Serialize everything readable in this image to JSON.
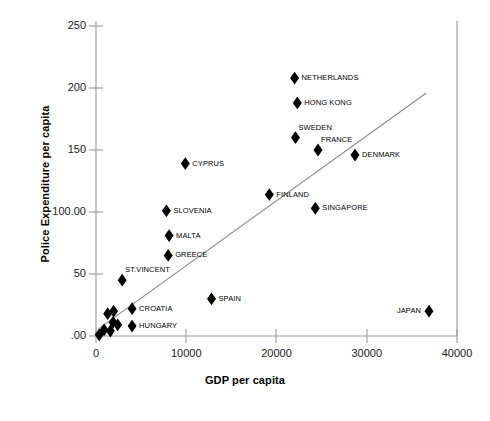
{
  "chart_data": {
    "type": "scatter",
    "title": "",
    "xlabel": "GDP per capita",
    "ylabel": "Police Expenditure per capita",
    "xlim": [
      0,
      40000
    ],
    "ylim": [
      0,
      260
    ],
    "grid": false,
    "legend": "none",
    "marker": "filled-diamond",
    "marker_color": "#000000",
    "xticks": [
      0,
      10000,
      20000,
      30000,
      40000
    ],
    "xtick_labels": [
      "0",
      "10000",
      "20000",
      "30000",
      "40000"
    ],
    "yticks": [
      0,
      50,
      100,
      150,
      200,
      250
    ],
    "ytick_labels": [
      ".00",
      "50",
      "100.00",
      "150",
      "200",
      "250"
    ],
    "trendline": {
      "present": true,
      "x_start": 300,
      "y_start": 6,
      "x_end": 36600,
      "y_end": 196
    },
    "points": [
      {
        "label": "NETHERLANDS",
        "x": 22000,
        "y": 208,
        "label_pos": "right"
      },
      {
        "label": "HONG KONG",
        "x": 22300,
        "y": 188,
        "label_pos": "right"
      },
      {
        "label": "SWEDEN",
        "x": 22100,
        "y": 160,
        "label_pos": "above-right"
      },
      {
        "label": "FRANCE",
        "x": 24600,
        "y": 150,
        "label_pos": "above-right"
      },
      {
        "label": "DENMARK",
        "x": 28700,
        "y": 146,
        "label_pos": "right"
      },
      {
        "label": "CYPRUS",
        "x": 9900,
        "y": 139,
        "label_pos": "right"
      },
      {
        "label": "FINLAND",
        "x": 19200,
        "y": 114,
        "label_pos": "right"
      },
      {
        "label": "SINGAPORE",
        "x": 24300,
        "y": 103,
        "label_pos": "right"
      },
      {
        "label": "SLOVENIA",
        "x": 7800,
        "y": 101,
        "label_pos": "right"
      },
      {
        "label": "MALTA",
        "x": 8100,
        "y": 81,
        "label_pos": "right"
      },
      {
        "label": "GREECE",
        "x": 8000,
        "y": 65,
        "label_pos": "right"
      },
      {
        "label": "ST.VINCENT",
        "x": 2900,
        "y": 45,
        "label_pos": "above-right"
      },
      {
        "label": "SPAIN",
        "x": 12800,
        "y": 30,
        "label_pos": "right"
      },
      {
        "label": "CROATIA",
        "x": 4000,
        "y": 22,
        "label_pos": "right"
      },
      {
        "label": "HUNGARY",
        "x": 4000,
        "y": 8,
        "label_pos": "right"
      },
      {
        "label": "JAPAN",
        "x": 36900,
        "y": 20,
        "label_pos": "left"
      },
      {
        "label": "",
        "x": 1300,
        "y": 18,
        "label_pos": "none"
      },
      {
        "label": "",
        "x": 1950,
        "y": 20,
        "label_pos": "none"
      },
      {
        "label": "",
        "x": 1900,
        "y": 11,
        "label_pos": "none"
      },
      {
        "label": "",
        "x": 2400,
        "y": 9,
        "label_pos": "none"
      },
      {
        "label": "",
        "x": 900,
        "y": 5,
        "label_pos": "none"
      },
      {
        "label": "",
        "x": 1600,
        "y": 4,
        "label_pos": "none"
      },
      {
        "label": "",
        "x": 350,
        "y": 1,
        "label_pos": "none"
      }
    ]
  },
  "axes": {
    "x_title": "GDP per capita",
    "y_title": "Police Expenditure per capita"
  },
  "ticks": {
    "y": [
      {
        "value": 250,
        "label": "250"
      },
      {
        "value": 200,
        "label": "200"
      },
      {
        "value": 150,
        "label": "150"
      },
      {
        "value": 100,
        "label": "100.00"
      },
      {
        "value": 50,
        "label": "50"
      },
      {
        "value": 0,
        "label": ".00"
      }
    ],
    "x": [
      {
        "value": 0,
        "label": "0"
      },
      {
        "value": 10000,
        "label": "10000"
      },
      {
        "value": 20000,
        "label": "20000"
      },
      {
        "value": 30000,
        "label": "30000"
      },
      {
        "value": 40000,
        "label": "40000"
      }
    ]
  },
  "style": {
    "axis_color": "#808080",
    "marker_color": "#000000",
    "trendline_color": "#808080",
    "text_color": "#000000",
    "background": "#ffffff"
  }
}
